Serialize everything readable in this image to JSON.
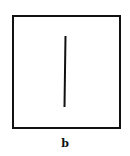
{
  "figure": {
    "label": "b",
    "frame_color": "#111111",
    "background": "#ffffff"
  }
}
